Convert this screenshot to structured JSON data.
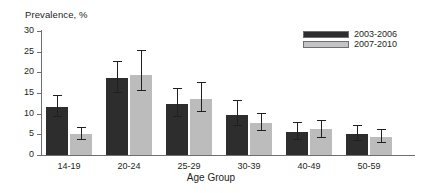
{
  "chart_data": {
    "type": "bar",
    "title": "",
    "ylabel": "Prevalence, %",
    "xlabel": "Age Group",
    "ylim": [
      0,
      30
    ],
    "yticks": [
      0,
      5,
      10,
      15,
      20,
      25,
      30
    ],
    "ytick_labels": [
      "0",
      "5",
      "10",
      "15",
      "20",
      "25",
      "30"
    ],
    "grid": false,
    "legend_position": "top-right",
    "categories": [
      "14-19",
      "20-24",
      "25-29",
      "30-39",
      "40-49",
      "50-59"
    ],
    "series": [
      {
        "name": "2003-2006",
        "color": "#2d2d2d",
        "values": [
          11.6,
          18.7,
          12.4,
          9.7,
          5.6,
          5.1
        ],
        "err_low": [
          9.1,
          15.0,
          9.3,
          7.0,
          3.6,
          3.3
        ],
        "err_high": [
          14.4,
          22.8,
          16.2,
          13.3,
          8.0,
          7.3
        ]
      },
      {
        "name": "2007-2010",
        "color": "#bcbcbc",
        "values": [
          5.1,
          19.3,
          13.5,
          7.7,
          6.2,
          4.3
        ],
        "err_low": [
          3.7,
          15.4,
          10.3,
          5.7,
          4.1,
          2.9
        ],
        "err_high": [
          6.7,
          25.3,
          17.6,
          10.1,
          8.4,
          6.2
        ]
      }
    ]
  }
}
